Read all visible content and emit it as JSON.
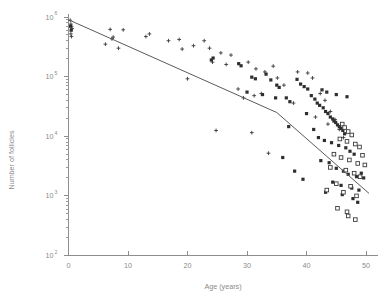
{
  "chart_data": {
    "type": "scatter",
    "title": "",
    "xlabel": "Age (years)",
    "ylabel": "Number of follicles",
    "xlim": [
      0,
      51
    ],
    "ylim": [
      100,
      1000000
    ],
    "yscale": "log",
    "xscale": "linear",
    "grid": false,
    "legend": "none",
    "xticks": [
      0,
      10,
      20,
      30,
      40,
      50
    ],
    "xtick_labels": [
      "0",
      "10",
      "20",
      "30",
      "40",
      "50"
    ],
    "yticks": [
      100,
      1000,
      10000,
      100000,
      1000000
    ],
    "ytick_labels": [
      "10 2",
      "10 3",
      "10 4",
      "10 5",
      "10 6"
    ],
    "ytick_mantissa": [
      "10",
      "10",
      "10",
      "10",
      "10"
    ],
    "ytick_exponents": [
      "2",
      "3",
      "4",
      "5",
      "6"
    ],
    "minor_ticks": "log-decade-subdivisions",
    "series": [
      {
        "name": "cross-markers",
        "marker": "plus",
        "points": [
          [
            0.3,
            880000
          ],
          [
            0.4,
            760000
          ],
          [
            0.5,
            700000
          ],
          [
            0.6,
            640000
          ],
          [
            0.4,
            520000
          ],
          [
            0.5,
            470000
          ],
          [
            7.0,
            620000
          ],
          [
            9.2,
            610000
          ],
          [
            6.2,
            350000
          ],
          [
            8.4,
            300000
          ],
          [
            7.3,
            430000
          ],
          [
            7.5,
            460000
          ],
          [
            13.0,
            470000
          ],
          [
            13.6,
            520000
          ],
          [
            16.8,
            400000
          ],
          [
            18.6,
            420000
          ],
          [
            19.1,
            290000
          ],
          [
            21.0,
            330000
          ],
          [
            22.8,
            400000
          ],
          [
            23.7,
            300000
          ],
          [
            25.6,
            250000
          ],
          [
            27.3,
            230000
          ],
          [
            20.0,
            92000
          ],
          [
            28.5,
            62000
          ],
          [
            29.4,
            44000
          ],
          [
            24.2,
            175000
          ],
          [
            26.5,
            160000
          ],
          [
            30.2,
            175000
          ],
          [
            31.5,
            135000
          ],
          [
            33.0,
            120000
          ],
          [
            34.4,
            150000
          ],
          [
            35.1,
            95000
          ],
          [
            36.2,
            72000
          ],
          [
            31.2,
            48000
          ],
          [
            32.4,
            52000
          ],
          [
            24.8,
            12500
          ],
          [
            30.8,
            11500
          ],
          [
            33.6,
            5200
          ],
          [
            37.8,
            36000
          ],
          [
            38.5,
            120000
          ],
          [
            40.2,
            115000
          ],
          [
            41.0,
            95000
          ],
          [
            42.3,
            52000
          ],
          [
            43.1,
            40000
          ],
          [
            44.0,
            26000
          ],
          [
            44.8,
            19000
          ],
          [
            45.5,
            13000
          ],
          [
            46.2,
            9500
          ],
          [
            41.5,
            21000
          ],
          [
            43.6,
            16000
          ]
        ]
      },
      {
        "name": "filled-square-markers",
        "marker": "filled-square",
        "points": [
          [
            0.35,
            700000
          ],
          [
            0.45,
            600000
          ],
          [
            24.0,
            190000
          ],
          [
            24.3,
            205000
          ],
          [
            28.6,
            165000
          ],
          [
            29.0,
            152000
          ],
          [
            30.8,
            98000
          ],
          [
            31.4,
            92000
          ],
          [
            33.2,
            110000
          ],
          [
            34.0,
            88000
          ],
          [
            35.0,
            72000
          ],
          [
            35.4,
            66000
          ],
          [
            30.0,
            55000
          ],
          [
            32.6,
            50000
          ],
          [
            34.8,
            44000
          ],
          [
            36.6,
            44000
          ],
          [
            37.2,
            38000
          ],
          [
            37.0,
            14500
          ],
          [
            38.4,
            90000
          ],
          [
            39.0,
            75000
          ],
          [
            39.6,
            68000
          ],
          [
            40.2,
            62000
          ],
          [
            40.8,
            48000
          ],
          [
            41.4,
            42000
          ],
          [
            41.8,
            36000
          ],
          [
            42.2,
            33000
          ],
          [
            42.8,
            30000
          ],
          [
            43.2,
            26000
          ],
          [
            43.6,
            24000
          ],
          [
            44.0,
            21000
          ],
          [
            44.4,
            19500
          ],
          [
            44.6,
            18000
          ],
          [
            44.9,
            17000
          ],
          [
            45.2,
            15500
          ],
          [
            45.5,
            14500
          ],
          [
            45.8,
            13500
          ],
          [
            46.1,
            12500
          ],
          [
            46.4,
            11000
          ],
          [
            42.6,
            60000
          ],
          [
            43.4,
            55000
          ],
          [
            45.0,
            50000
          ],
          [
            46.8,
            46000
          ],
          [
            40.0,
            24000
          ],
          [
            41.2,
            13000
          ],
          [
            42.0,
            9500
          ],
          [
            43.0,
            8500
          ],
          [
            44.2,
            7800
          ],
          [
            45.4,
            7000
          ],
          [
            46.6,
            6400
          ],
          [
            47.3,
            5600
          ],
          [
            48.0,
            5000
          ],
          [
            42.4,
            3900
          ],
          [
            43.8,
            3600
          ],
          [
            45.0,
            2900
          ],
          [
            46.2,
            2600
          ],
          [
            47.0,
            2300
          ],
          [
            48.4,
            2100
          ],
          [
            44.4,
            1700
          ],
          [
            45.8,
            1500
          ],
          [
            47.6,
            1350
          ],
          [
            48.8,
            1250
          ],
          [
            43.2,
            1150
          ],
          [
            46.0,
            1050
          ],
          [
            49.2,
            2400
          ],
          [
            49.6,
            2000
          ],
          [
            38.0,
            2600
          ],
          [
            39.4,
            1900
          ],
          [
            36.0,
            4400
          ],
          [
            47.8,
            900
          ],
          [
            48.6,
            780
          ]
        ]
      },
      {
        "name": "open-square-markers",
        "marker": "open-square",
        "points": [
          [
            46.0,
            16000
          ],
          [
            46.4,
            14000
          ],
          [
            47.0,
            12000
          ],
          [
            47.6,
            10500
          ],
          [
            45.6,
            9000
          ],
          [
            46.8,
            8200
          ],
          [
            48.2,
            7400
          ],
          [
            48.9,
            6600
          ],
          [
            44.6,
            5000
          ],
          [
            45.8,
            4400
          ],
          [
            47.2,
            4000
          ],
          [
            48.6,
            3500
          ],
          [
            49.4,
            4800
          ],
          [
            44.0,
            3000
          ],
          [
            46.6,
            2700
          ],
          [
            48.0,
            2400
          ],
          [
            49.0,
            2100
          ],
          [
            45.0,
            1600
          ],
          [
            47.4,
            1450
          ],
          [
            43.4,
            1250
          ],
          [
            46.2,
            1150
          ],
          [
            48.4,
            1000
          ],
          [
            49.8,
            3300
          ],
          [
            45.2,
            620
          ],
          [
            46.8,
            540
          ],
          [
            47.0,
            460
          ],
          [
            48.2,
            400
          ]
        ]
      }
    ],
    "fit_line": {
      "name": "piecewise-regression-line",
      "description": "bi-exponential fitted decline with breakpoint",
      "vertices": [
        [
          0.0,
          900000
        ],
        [
          35.0,
          25000
        ],
        [
          50.5,
          1100
        ]
      ]
    }
  }
}
